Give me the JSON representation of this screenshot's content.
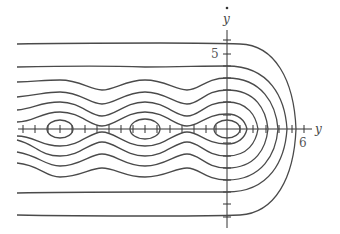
{
  "diagram": {
    "type": "phase-portrait",
    "axes": {
      "horizontal_label": "y",
      "vertical_label": "ẏ",
      "horizontal_tick_label": "6",
      "vertical_tick_label": "5"
    },
    "colors": {
      "curves": "#4a4a4a",
      "axes": "#333333",
      "background": "#ffffff"
    },
    "equilibria_centers_px": [
      [
        60,
        129
      ],
      [
        145,
        129
      ],
      [
        227,
        129
      ]
    ]
  }
}
